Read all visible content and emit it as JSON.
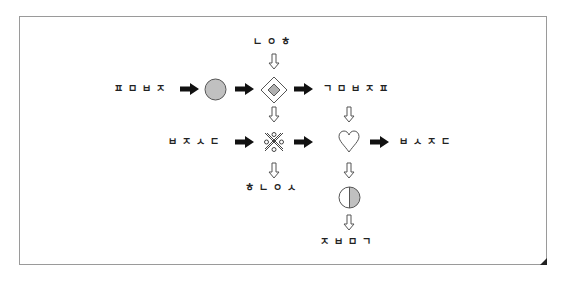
{
  "diagram": {
    "labels": {
      "top": "ㄴㅇㅎ",
      "row1_left": "ㅍㅁㅂㅈ",
      "row1_right": "ㄱㅁㅂㅈㅍ",
      "row2_left": "ㅂㅈㅅㄷ",
      "row2_right": "ㅂㅅㅈㄷ",
      "bottom_left": "ㅎㄴㅇㅅ",
      "bottom_right": "ㅈㅂㅁㄱ"
    },
    "nodes": [
      {
        "id": "gray-circle",
        "shape": "circle",
        "fill": "#c0c0c0"
      },
      {
        "id": "diamond",
        "shape": "diamond-in-diamond",
        "fill": "#b0b0b0"
      },
      {
        "id": "crossed-pattern",
        "shape": "x-cross-with-circles"
      },
      {
        "id": "heart",
        "shape": "heart-outline"
      },
      {
        "id": "half-circle",
        "shape": "half-filled-circle",
        "fill": "#c0c0c0"
      }
    ],
    "arrows": {
      "solid_color": "#111111",
      "hollow_stroke": "#555555"
    }
  }
}
